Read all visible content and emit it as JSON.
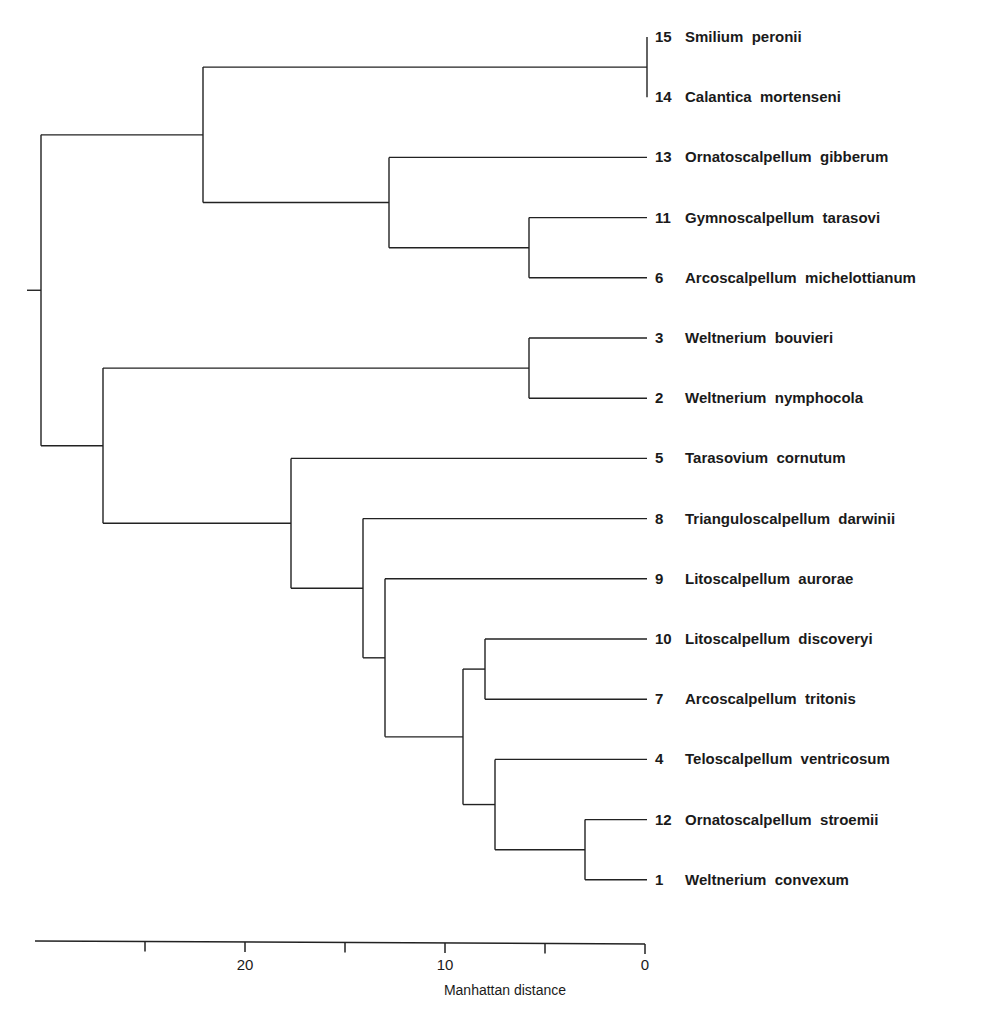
{
  "chart_data": {
    "type": "dendrogram",
    "title": "",
    "xlabel": "Manhattan distance",
    "ylabel": "",
    "xlim": [
      30.5,
      0
    ],
    "x_ticks": [
      25,
      20,
      15,
      10,
      5,
      0
    ],
    "x_tick_labels": [
      "",
      "20",
      "",
      "10",
      "",
      "0"
    ],
    "grid": false,
    "leaves": [
      {
        "id": 15,
        "genus": "Smilium",
        "species": "peronii"
      },
      {
        "id": 14,
        "genus": "Calantica",
        "species": "mortenseni"
      },
      {
        "id": 13,
        "genus": "Ornatoscalpellum",
        "species": "gibberum"
      },
      {
        "id": 11,
        "genus": "Gymnoscalpellum",
        "species": "tarasovi"
      },
      {
        "id": 6,
        "genus": "Arcoscalpellum",
        "species": "michelottianum"
      },
      {
        "id": 3,
        "genus": "Weltnerium",
        "species": "bouvieri"
      },
      {
        "id": 2,
        "genus": "Weltnerium",
        "species": "nymphocola"
      },
      {
        "id": 5,
        "genus": "Tarasovium",
        "species": "cornutum"
      },
      {
        "id": 8,
        "genus": "Trianguloscalpellum",
        "species": "darwinii"
      },
      {
        "id": 9,
        "genus": "Litoscalpellum",
        "species": "aurorae"
      },
      {
        "id": 10,
        "genus": "Litoscalpellum",
        "species": "discoveryi"
      },
      {
        "id": 7,
        "genus": "Arcoscalpellum",
        "species": "tritonis"
      },
      {
        "id": 4,
        "genus": "Teloscalpellum",
        "species": "ventricosum"
      },
      {
        "id": 12,
        "genus": "Ornatoscalpellum",
        "species": "stroemii"
      },
      {
        "id": 1,
        "genus": "Weltnerium",
        "species": "convexum"
      }
    ],
    "merges": [
      {
        "node": "A",
        "children": [
          15,
          14
        ],
        "distance": 0.0
      },
      {
        "node": "B",
        "children": [
          11,
          6
        ],
        "distance": 5.9
      },
      {
        "node": "C",
        "children": [
          3,
          2
        ],
        "distance": 5.9
      },
      {
        "node": "D",
        "children": [
          12,
          1
        ],
        "distance": 3.1
      },
      {
        "node": "E",
        "children": [
          4,
          "D"
        ],
        "distance": 7.6
      },
      {
        "node": "F",
        "children": [
          10,
          7
        ],
        "distance": 8.1
      },
      {
        "node": "G",
        "children": [
          "F",
          "E"
        ],
        "distance": 9.2
      },
      {
        "node": "H",
        "children": [
          9,
          "G"
        ],
        "distance": 13.1
      },
      {
        "node": "I",
        "children": [
          8,
          "H"
        ],
        "distance": 14.2
      },
      {
        "node": "J",
        "children": [
          13,
          "B"
        ],
        "distance": 12.9
      },
      {
        "node": "K",
        "children": [
          "A",
          "J"
        ],
        "distance": 22.2
      },
      {
        "node": "L",
        "children": [
          5,
          "I"
        ],
        "distance": 17.8
      },
      {
        "node": "M",
        "children": [
          "C",
          "L"
        ],
        "distance": 27.2
      },
      {
        "node": "ROOT",
        "children": [
          "K",
          "M"
        ],
        "distance": 30.3
      }
    ]
  }
}
